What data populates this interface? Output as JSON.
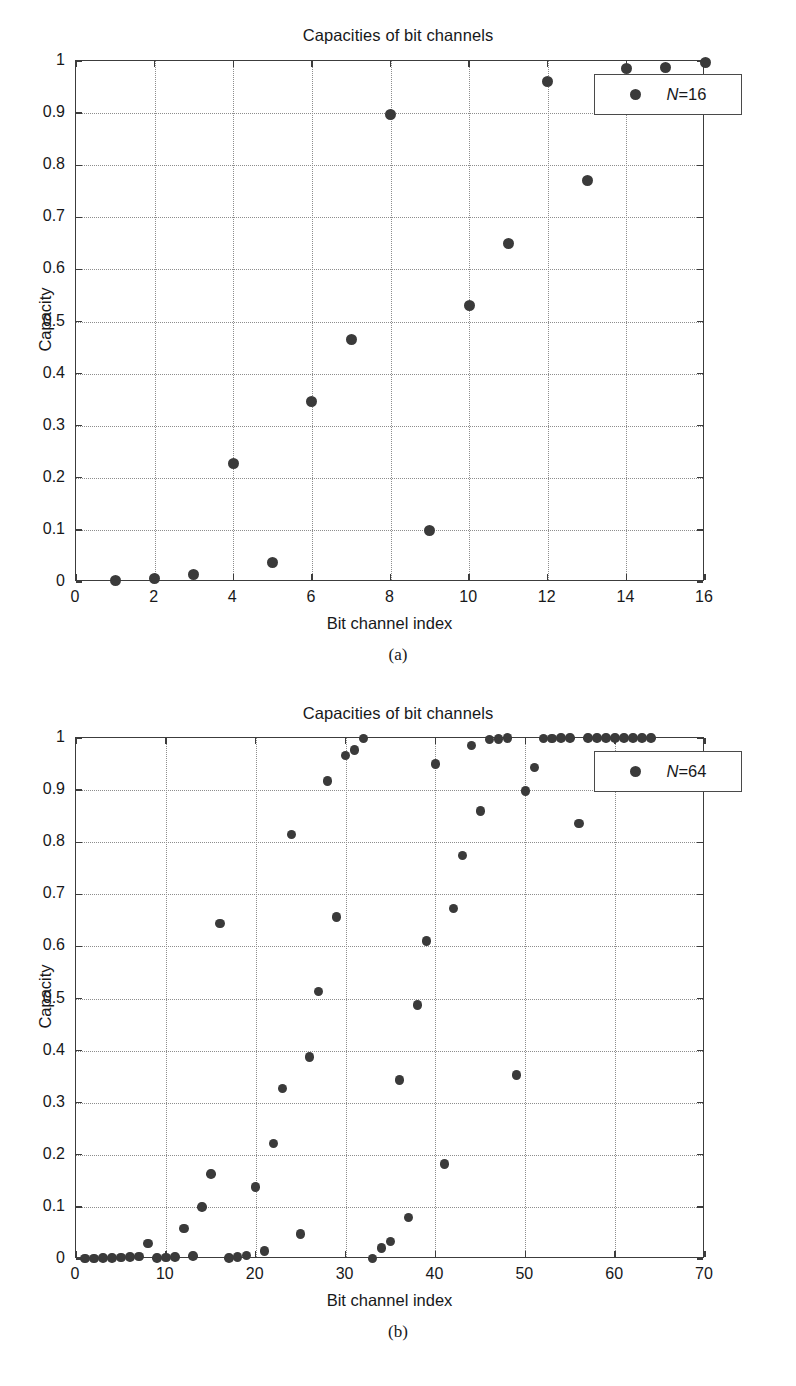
{
  "figure": {
    "panels": [
      {
        "caption": "(a)",
        "legend_label_prefix": "N",
        "legend_label_eq": "=",
        "legend_label_value": "16"
      },
      {
        "caption": "(b)",
        "legend_label_prefix": "N",
        "legend_label_eq": "=",
        "legend_label_value": "64"
      }
    ]
  },
  "chart_data": [
    {
      "type": "scatter",
      "title": "Capacities of bit channels",
      "xlabel": "Bit channel index",
      "ylabel": "Capacity",
      "xlim": [
        0,
        16
      ],
      "ylim": [
        0,
        1
      ],
      "xticks": [
        0,
        2,
        4,
        6,
        8,
        10,
        12,
        14,
        16
      ],
      "xtick_labels": [
        "0",
        "2",
        "4",
        "6",
        "8",
        "10",
        "12",
        "14",
        "16"
      ],
      "yticks": [
        0,
        0.1,
        0.2,
        0.3,
        0.4,
        0.5,
        0.6,
        0.7,
        0.8,
        0.9,
        1
      ],
      "ytick_labels": [
        "0",
        "0.1",
        "0.2",
        "0.3",
        "0.4",
        "0.5",
        "0.6",
        "0.7",
        "0.8",
        "0.9",
        "1"
      ],
      "grid": true,
      "legend": [
        "N = 16"
      ],
      "legend_position": "upper right",
      "marker_color": "#3a3a3a",
      "series": [
        {
          "name": "N = 16",
          "x": [
            1,
            2,
            3,
            4,
            5,
            6,
            7,
            8,
            9,
            10,
            11,
            12,
            13,
            14,
            15,
            16
          ],
          "y": [
            0.002,
            0.007,
            0.015,
            0.227,
            0.038,
            0.346,
            0.466,
            0.898,
            0.099,
            0.53,
            0.65,
            0.96,
            0.77,
            0.986,
            0.988,
            0.998
          ]
        }
      ]
    },
    {
      "type": "scatter",
      "title": "Capacities of bit channels",
      "xlabel": "Bit channel index",
      "ylabel": "Capacity",
      "xlim": [
        0,
        70
      ],
      "ylim": [
        0,
        1
      ],
      "xticks": [
        0,
        10,
        20,
        30,
        40,
        50,
        60,
        70
      ],
      "xtick_labels": [
        "0",
        "10",
        "20",
        "30",
        "40",
        "50",
        "60",
        "70"
      ],
      "yticks": [
        0,
        0.1,
        0.2,
        0.3,
        0.4,
        0.5,
        0.6,
        0.7,
        0.8,
        0.9,
        1
      ],
      "ytick_labels": [
        "0",
        "0.1",
        "0.2",
        "0.3",
        "0.4",
        "0.5",
        "0.6",
        "0.7",
        "0.8",
        "0.9",
        "1"
      ],
      "grid": true,
      "legend": [
        "N = 64"
      ],
      "legend_position": "upper right",
      "marker_color": "#3a3a3a",
      "series": [
        {
          "name": "N = 64",
          "x": [
            1,
            2,
            3,
            4,
            5,
            6,
            7,
            8,
            9,
            10,
            11,
            12,
            13,
            14,
            15,
            16,
            17,
            18,
            19,
            20,
            21,
            22,
            23,
            24,
            25,
            26,
            27,
            28,
            29,
            30,
            31,
            32,
            33,
            34,
            35,
            36,
            37,
            38,
            39,
            40,
            41,
            42,
            43,
            44,
            45,
            46,
            47,
            48,
            49,
            50,
            51,
            52,
            53,
            54,
            55,
            56,
            57,
            58,
            59,
            60,
            61,
            62,
            63,
            64
          ],
          "y": [
            0.001,
            0.001,
            0.002,
            0.002,
            0.003,
            0.004,
            0.005,
            0.03,
            0.002,
            0.003,
            0.004,
            0.059,
            0.006,
            0.1,
            0.163,
            0.644,
            0.002,
            0.004,
            0.007,
            0.138,
            0.015,
            0.222,
            0.327,
            0.815,
            0.048,
            0.388,
            0.513,
            0.917,
            0.656,
            0.966,
            0.977,
            0.999,
            0.001,
            0.021,
            0.034,
            0.344,
            0.08,
            0.488,
            0.61,
            0.95,
            0.182,
            0.673,
            0.774,
            0.986,
            0.86,
            0.997,
            0.998,
            1.0,
            0.353,
            0.898,
            0.943,
            0.999,
            0.999,
            1.0,
            1.0,
            0.836,
            1.0,
            1.0,
            1.0,
            1.0,
            1.0,
            1.0,
            1.0,
            1.0
          ]
        }
      ]
    }
  ]
}
